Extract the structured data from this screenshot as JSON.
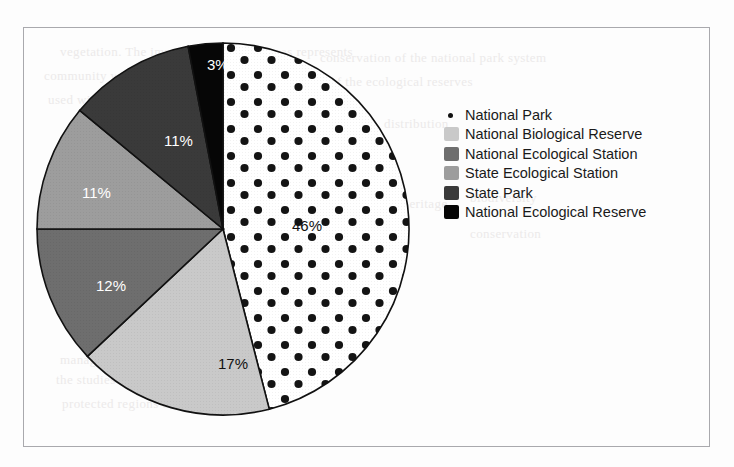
{
  "chart_data": {
    "type": "pie",
    "title": "",
    "categories": [
      "National Park",
      "National Biological Reserve",
      "National Ecological Station",
      "State Ecological Station",
      "State Park",
      "National Ecological Reserve"
    ],
    "values": [
      46,
      17,
      12,
      11,
      11,
      3
    ],
    "value_labels": [
      "46%",
      "17%",
      "12%",
      "11%",
      "11%",
      "3%"
    ],
    "colors": [
      "#ffffff",
      "#c9c9c9",
      "#6e6e6e",
      "#9d9d9d",
      "#3a3a3a",
      "#060606"
    ],
    "label_text_colors": [
      "#111111",
      "#111111",
      "#ffffff",
      "#ffffff",
      "#ffffff",
      "#ffffff"
    ],
    "legend_position": "right",
    "grid": false,
    "start_angle_deg": 0,
    "direction": "clockwise"
  },
  "legend": {
    "items": [
      {
        "label": "National Park",
        "swatch": "dotted-white-swatch",
        "color": "#ffffff"
      },
      {
        "label": "National Biological Reserve",
        "swatch": "light-gray-swatch",
        "color": "#c9c9c9"
      },
      {
        "label": "National Ecological Station",
        "swatch": "medium-dark-gray-swatch",
        "color": "#6e6e6e"
      },
      {
        "label": "State Ecological Station",
        "swatch": "medium-gray-swatch",
        "color": "#9d9d9d"
      },
      {
        "label": "State Park",
        "swatch": "dark-gray-swatch",
        "color": "#3a3a3a"
      },
      {
        "label": "National Ecological Reserve",
        "swatch": "black-swatch",
        "color": "#060606"
      }
    ]
  },
  "slice_labels": [
    {
      "text": "46%",
      "x": 292,
      "y": 217,
      "color": "#111111"
    },
    {
      "text": "17%",
      "x": 218,
      "y": 355,
      "color": "#111111"
    },
    {
      "text": "12%",
      "x": 96,
      "y": 277,
      "color": "#ffffff"
    },
    {
      "text": "11%",
      "x": 82,
      "y": 184,
      "color": "#ffffff"
    },
    {
      "text": "11%",
      "x": 164,
      "y": 132,
      "color": "#ffffff"
    },
    {
      "text": "3%",
      "x": 207,
      "y": 56,
      "color": "#ffffff"
    }
  ],
  "bleed_through": [
    {
      "text": "vegetation. The importance of these areas represents",
      "x": 60,
      "y": 44
    },
    {
      "text": "community with regard to conservation strategy",
      "x": 44,
      "y": 68
    },
    {
      "text": "used within the protected areas of conservation",
      "x": 48,
      "y": 92
    },
    {
      "text": "conservation of the national park system",
      "x": 320,
      "y": 50
    },
    {
      "text": "of the ecological reserves",
      "x": 330,
      "y": 74
    },
    {
      "text": "distribution",
      "x": 384,
      "y": 116
    },
    {
      "text": "management",
      "x": 60,
      "y": 352
    },
    {
      "text": "the studies of conservation in the area",
      "x": 56,
      "y": 372
    },
    {
      "text": "protected regions of the state",
      "x": 62,
      "y": 396
    },
    {
      "text": "natural heritage",
      "x": 360,
      "y": 196
    },
    {
      "text": "biodiversity",
      "x": 470,
      "y": 190
    },
    {
      "text": "conservation",
      "x": 470,
      "y": 226
    }
  ]
}
